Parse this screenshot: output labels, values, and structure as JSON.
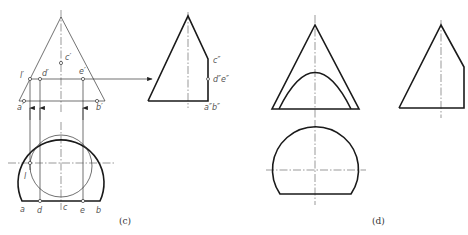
{
  "figure_c": {
    "caption": "(c)",
    "front_view": {
      "labels": {
        "l": "l′",
        "d": "d′",
        "c": "c′",
        "e": "e′",
        "a": "a′",
        "b": "b′"
      }
    },
    "side_view": {
      "labels": {
        "c": "c″",
        "de": "d″e″",
        "ab": "a″b″"
      }
    },
    "top_view": {
      "labels": {
        "l": "l",
        "a": "a",
        "d": "d",
        "c": "c",
        "e": "e",
        "b": "b"
      }
    }
  },
  "figure_d": {
    "caption": "(d)"
  }
}
